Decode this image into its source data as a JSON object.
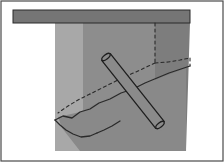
{
  "figure": {
    "title": "",
    "caption": "",
    "type": "technical-sketch",
    "width": 224,
    "height": 162
  },
  "colors": {
    "page_background": "#ffffff",
    "frame_border": "#4a4a4a",
    "top_band": "#757575",
    "stratum_light": "#a8a8a8",
    "stratum_medium": "#8d8d8d",
    "stratum_dark": "#7d7d7d",
    "wedge_lower": "#898989",
    "line_ink": "#2a2a2a",
    "rod_fill": "#8a8a8a",
    "rod_outline": "#1f1f1f"
  },
  "frame": {
    "name": "outer-border",
    "x": 1,
    "y": 1,
    "width": 222,
    "height": 160,
    "stroke_width": 1.2
  },
  "top_band": {
    "name": "surface-layer-band",
    "x": 13,
    "y": 10,
    "width": 177,
    "height": 13
  },
  "strata": [
    {
      "name": "stratum-light-left",
      "label": "",
      "points": "55,22 83,22 83,151 55,151",
      "fill_key": "stratum_light"
    },
    {
      "name": "stratum-medium-center",
      "label": "",
      "points": "83,22 155,22 155,151 83,151",
      "fill_key": "stratum_medium"
    },
    {
      "name": "stratum-dark-right",
      "label": "",
      "points": "155,22 190,22 186,151 155,151",
      "fill_key": "stratum_dark"
    }
  ],
  "wedge": {
    "name": "failure-wedge-lower-region",
    "points": "58,117 80,112 95,104 118,94 140,86 162,77 186,68 186,151 80,151 62,128",
    "fill_key": "wedge_lower"
  },
  "solid_lines": [
    {
      "name": "wedge-upper-boundary-line",
      "points": "55,120 63,116 72,118 80,112 90,109 99,103 110,99 121,93 133,89 145,83 157,78 169,73 181,69 190,66",
      "dashed": false,
      "stroke_width": 1.3
    },
    {
      "name": "wedge-lower-boundary-line",
      "points": "55,120 60,125 66,130 73,134 81,137 90,136 97,133",
      "dashed": false,
      "stroke_width": 1.3
    },
    {
      "name": "wedge-toe-line",
      "points": "97,133 104,130 112,126 120,121",
      "dashed": false,
      "stroke_width": 1.3
    }
  ],
  "dashed_lines": [
    {
      "name": "vertical-projection-line",
      "points": "155,23 155,63",
      "dashed": true,
      "stroke_width": 1.1,
      "dash_pattern": "3,3"
    },
    {
      "name": "plane-back-edge-dashed",
      "points": "155,63 168,62 180,60 190,58",
      "dashed": true,
      "stroke_width": 1.1,
      "dash_pattern": "3,3"
    },
    {
      "name": "plane-right-edge-dashed",
      "points": "190,58 190,66",
      "dashed": true,
      "stroke_width": 1.1,
      "dash_pattern": "3,3"
    },
    {
      "name": "plane-left-edge-dashed",
      "points": "155,63 138,71 120,79 104,87 90,94",
      "dashed": true,
      "stroke_width": 1.1,
      "dash_pattern": "3,3"
    },
    {
      "name": "plane-lower-left-dashed",
      "points": "90,94 78,100 68,106 58,113",
      "dashed": true,
      "stroke_width": 1.1,
      "dash_pattern": "3,3"
    }
  ],
  "rod": {
    "name": "inclined-rod-member",
    "label": "",
    "head_x": 106,
    "head_y": 57,
    "tail_x": 160,
    "tail_y": 125,
    "thickness": 11,
    "cap_radius": 5
  },
  "annotations": []
}
